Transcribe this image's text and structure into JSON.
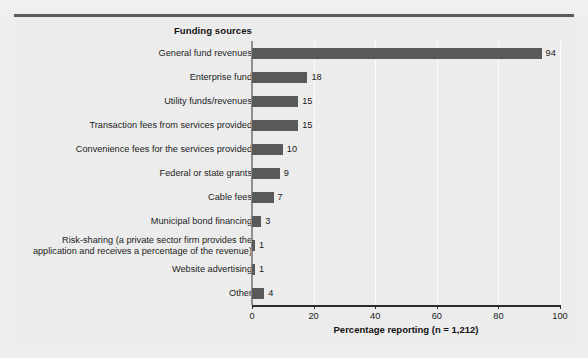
{
  "figure": {
    "background_color": "#ececec",
    "bar_color": "#595959",
    "rule_color": "#5b5b5b",
    "ghost_text": "uu  uu   u     uu    uu"
  },
  "chart_data": {
    "type": "bar",
    "orientation": "horizontal",
    "title": "",
    "category_axis_title": "Funding sources",
    "xlabel": "Percentage reporting (n = 1,212)",
    "ylabel": "",
    "xlim": [
      0,
      100
    ],
    "grid": true,
    "legend": "none",
    "xticks": [
      "0",
      "20",
      "40",
      "60",
      "80",
      "100"
    ],
    "xtick_values": [
      0,
      20,
      40,
      60,
      80,
      100
    ],
    "categories": [
      "General fund revenues",
      "Enterprise fund",
      "Utility funds/revenues",
      "Transaction fees from services provided",
      "Convenience fees for the services provided",
      "Federal or state grants",
      "Cable fees",
      "Municipal bond financing",
      "Risk-sharing (a private sector firm provides the\napplication and receives a percentage of the revenue)",
      "Website advertising",
      "Other"
    ],
    "values": [
      94,
      18,
      15,
      15,
      10,
      9,
      7,
      3,
      1,
      1,
      4
    ],
    "value_labels": [
      "94",
      "18",
      "15",
      "15",
      "10",
      "9",
      "7",
      "3",
      "1",
      "1",
      "4"
    ]
  }
}
